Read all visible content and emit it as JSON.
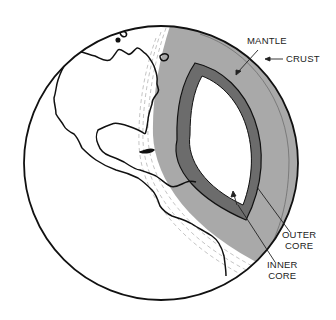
{
  "diagram": {
    "labels": {
      "mantle": "MANTLE",
      "crust": "CRUST",
      "outer_core": [
        "OUTER",
        "CORE"
      ],
      "inner_core": [
        "INNER",
        "CORE"
      ]
    },
    "colors": {
      "background": "#ffffff",
      "outline": "#111111",
      "mantle": "#a9a9a9",
      "crust_line": "#6e6e6e",
      "outer_core": "#6c6c6c",
      "inner_core": "#ffffff",
      "dashed_lines": "#bdbdbd",
      "label_text": "#222222"
    }
  }
}
